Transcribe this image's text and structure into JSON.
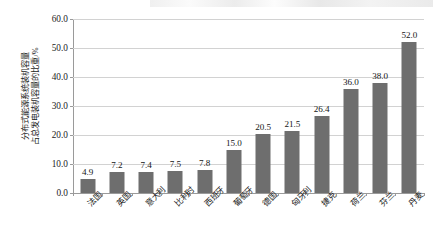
{
  "chart_data": {
    "type": "bar",
    "title": "",
    "xlabel": "",
    "ylabel": "分布式能源系统装机容量占总发电装机容量的比重/%",
    "ylabel_line1": "分布式能源系统装机容量",
    "ylabel_line2": "占总发电装机容量的比重/%",
    "ylim": [
      0,
      60
    ],
    "ytick_labels": [
      "60.0",
      "50.0",
      "40.0",
      "30.0",
      "20.0",
      "10.0",
      "0.0"
    ],
    "ytick_values": [
      60,
      50,
      40,
      30,
      20,
      10,
      0
    ],
    "grid": "horizontal",
    "legend": "none",
    "bar_color": "#6e6e6e",
    "categories": [
      "法国",
      "英国",
      "意大利",
      "比利时",
      "西班牙",
      "葡萄牙",
      "德国",
      "匈牙利",
      "捷克",
      "荷兰",
      "芬兰",
      "丹麦"
    ],
    "values": [
      4.9,
      7.2,
      7.4,
      7.5,
      7.8,
      15.0,
      20.5,
      21.5,
      26.4,
      36.0,
      38.0,
      52.0
    ],
    "value_labels": [
      "4.9",
      "7.2",
      "7.4",
      "7.5",
      "7.8",
      "15.0",
      "20.5",
      "21.5",
      "26.4",
      "36.0",
      "38.0",
      "52.0"
    ]
  }
}
